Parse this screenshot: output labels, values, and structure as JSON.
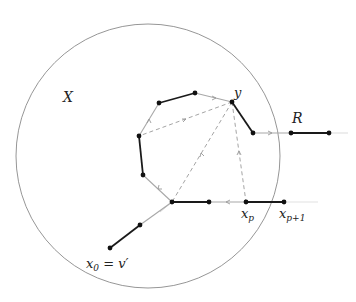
{
  "diagram": {
    "type": "graph-path-figure",
    "colors": {
      "circle": "#888888",
      "thick_edge": "#1a1a1a",
      "thin_edge": "#aaaaaa",
      "dashed": "#999999",
      "node": "#111111",
      "faint_tail": "#dddddd"
    },
    "circle": {
      "cx": 148,
      "cy": 156,
      "r": 132
    },
    "labels": {
      "region": "X",
      "path": "R",
      "target": "y",
      "start_main": "x",
      "start_sub": "0",
      "start_eq": " = v′",
      "xp_main": "x",
      "xp_sub": "p",
      "xp1_main": "x",
      "xp1_sub": "p+1"
    },
    "nodes": [
      {
        "id": "x0",
        "x": 110,
        "y": 248
      },
      {
        "id": "n1",
        "x": 140,
        "y": 225
      },
      {
        "id": "hub",
        "x": 172,
        "y": 202
      },
      {
        "id": "n3",
        "x": 209,
        "y": 202
      },
      {
        "id": "xp",
        "x": 246,
        "y": 202
      },
      {
        "id": "xp1",
        "x": 284,
        "y": 202
      },
      {
        "id": "l1",
        "x": 143,
        "y": 175
      },
      {
        "id": "l2",
        "x": 139,
        "y": 136
      },
      {
        "id": "t1",
        "x": 159,
        "y": 103
      },
      {
        "id": "t2",
        "x": 195,
        "y": 93
      },
      {
        "id": "y",
        "x": 232,
        "y": 102
      },
      {
        "id": "r0",
        "x": 253,
        "y": 133
      },
      {
        "id": "r1",
        "x": 291,
        "y": 133
      },
      {
        "id": "r2",
        "x": 329,
        "y": 133
      }
    ],
    "thick_edges": [
      [
        "x0",
        "n1"
      ],
      [
        "hub",
        "n3"
      ],
      [
        "xp",
        "xp1"
      ],
      [
        "l1",
        "l2"
      ],
      [
        "t1",
        "t2"
      ],
      [
        "y",
        "r0"
      ],
      [
        "r1",
        "r2"
      ]
    ],
    "thin_edges": [
      [
        "n1",
        "hub"
      ],
      [
        "n3",
        "xp"
      ],
      [
        "hub",
        "l1"
      ],
      [
        "l2",
        "t1"
      ],
      [
        "t2",
        "y"
      ],
      [
        "r0",
        "r1"
      ]
    ],
    "dashed_edges": [
      [
        "y",
        "l2"
      ],
      [
        "y",
        "hub"
      ],
      [
        "y",
        "xp"
      ]
    ]
  }
}
